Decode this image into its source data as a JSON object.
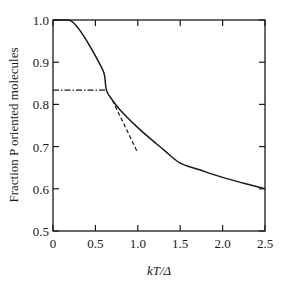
{
  "chart_data": {
    "type": "line",
    "title": "",
    "xlabel": "kT/Δ",
    "ylabel": "Fraction P oriented molecules",
    "xlim": [
      0,
      2.5
    ],
    "ylim": [
      0.5,
      1.0
    ],
    "grid": false,
    "legend": null,
    "x_ticks": [
      "0",
      "0.5",
      "1.0",
      "1.5",
      "2.0",
      "2.5"
    ],
    "y_ticks": [
      "0.5",
      "0.6",
      "0.7",
      "0.8",
      "0.9",
      "1.0"
    ],
    "series": [
      {
        "name": "P(kT/Δ)",
        "style": "solid",
        "x": [
          0.0,
          0.15,
          0.22,
          0.3,
          0.4,
          0.5,
          0.6,
          0.63,
          0.7,
          0.8,
          1.0,
          1.2,
          1.32,
          1.5,
          1.73,
          2.0,
          2.25,
          2.5
        ],
        "y": [
          1.0,
          1.0,
          0.997,
          0.98,
          0.95,
          0.915,
          0.875,
          0.834,
          0.81,
          0.785,
          0.745,
          0.71,
          0.69,
          0.661,
          0.645,
          0.627,
          0.613,
          0.6
        ]
      },
      {
        "name": "tangent",
        "style": "dashed",
        "x": [
          0.7,
          1.0
        ],
        "y": [
          0.81,
          0.685
        ]
      },
      {
        "name": "reference level",
        "style": "dash-dot",
        "x": [
          0.0,
          0.63
        ],
        "y": [
          0.834,
          0.834
        ]
      }
    ]
  }
}
